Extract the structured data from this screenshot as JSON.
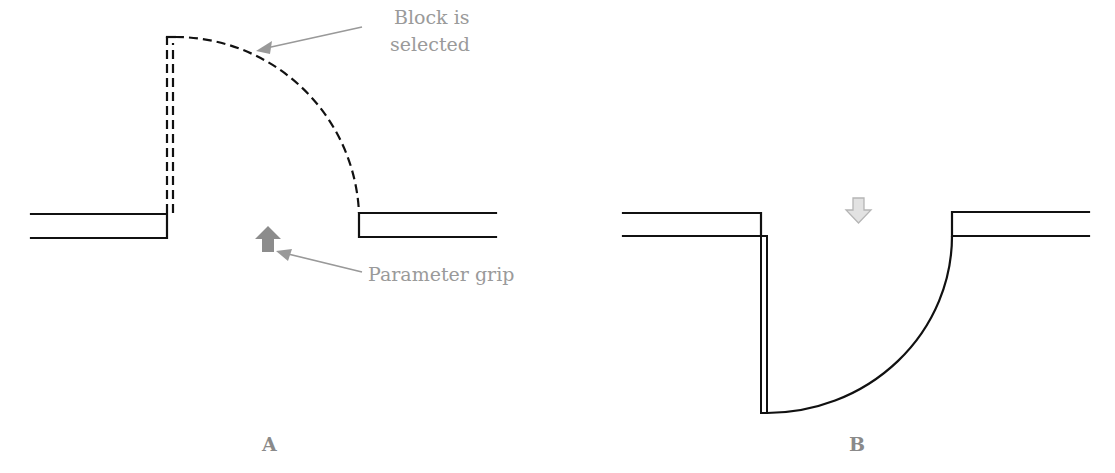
{
  "diagram": {
    "panels": [
      {
        "id": "A",
        "label": "A",
        "state": "door swing open upward, block selected",
        "door_style": "dashed"
      },
      {
        "id": "B",
        "label": "B",
        "state": "door swing flipped downward",
        "door_style": "solid"
      }
    ],
    "callouts": {
      "block_selected_line1": "Block is",
      "block_selected_line2": "selected",
      "parameter_grip": "Parameter grip"
    },
    "icons": {
      "grip_a": "up-arrow-grip-icon",
      "grip_b": "down-arrow-grip-icon"
    },
    "colors": {
      "line": "#111111",
      "callout": "#999999",
      "grip_fill_a": "#8c8c8c",
      "grip_fill_b": "#e2e2e2",
      "grip_stroke_b": "#b5b5b5"
    }
  }
}
